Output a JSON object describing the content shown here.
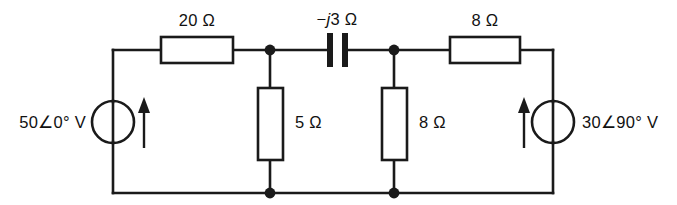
{
  "diagram": {
    "background_color": "#ffffff",
    "line_color": "#1a1a1a"
  },
  "sources": {
    "left": {
      "label": "50∠0° V",
      "magnitude": "50",
      "angle": "0°",
      "unit": "V",
      "arrow_direction": "up"
    },
    "right": {
      "label": "30∠90° V",
      "magnitude": "30",
      "angle": "90°",
      "unit": "V",
      "arrow_direction": "up"
    }
  },
  "components": {
    "r_top_left": {
      "label": "20 Ω",
      "value": "20",
      "unit": "Ω",
      "type": "resistor",
      "orientation": "horizontal"
    },
    "capacitor": {
      "label_prefix": "−",
      "label_italic": "j",
      "label_suffix": "3 Ω",
      "label": "−j3 Ω",
      "value": "-3",
      "unit": "Ω",
      "type": "capacitor",
      "orientation": "horizontal"
    },
    "r_top_right": {
      "label": "8 Ω",
      "value": "8",
      "unit": "Ω",
      "type": "resistor",
      "orientation": "horizontal"
    },
    "r_shunt_left": {
      "label": "5 Ω",
      "value": "5",
      "unit": "Ω",
      "type": "resistor",
      "orientation": "vertical"
    },
    "r_shunt_right": {
      "label": "8 Ω",
      "value": "8",
      "unit": "Ω",
      "type": "resistor",
      "orientation": "vertical"
    }
  },
  "nodes": {
    "count": 4,
    "junction_labels": []
  }
}
